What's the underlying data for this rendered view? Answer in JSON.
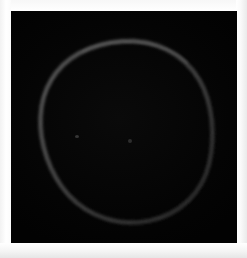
{
  "image": {
    "title": "Dark-field ellipse outline",
    "alt_text": "Faint grey ovoid outline on a black background framed by a white border",
    "frame": {
      "background_color": "#fdfdfd",
      "border_inset_px": 11,
      "width_px": 247,
      "height_px": 258
    },
    "panel": {
      "background_color": "#050505",
      "x_px": 11,
      "y_px": 11,
      "width_px": 226,
      "height_px": 232
    }
  },
  "chart_data": {
    "type": "scatter",
    "title": "Dark-field ellipse outline",
    "subtitle": "",
    "xlabel": "",
    "ylabel": "",
    "xlim": [
      0,
      226
    ],
    "ylim": [
      0,
      232
    ],
    "grid": false,
    "legend": "none",
    "background_color": "#050505",
    "annotations": [],
    "shapes": [
      {
        "name": "ellipse-outline",
        "kind": "closed-curve",
        "center_x": 118,
        "center_y": 124,
        "radius_x": 82,
        "radius_y": 94,
        "rotation_deg": -4,
        "stroke_color": "#4a4a4a",
        "stroke_width_px": 3,
        "fill": "none",
        "notes": "slightly irregular ovoid; brighter along upper-left arc, dimmer at lower-right"
      }
    ],
    "points": [
      {
        "name": "speck-left",
        "x": 66,
        "y": 126,
        "brightness": 0.07
      },
      {
        "name": "speck-center",
        "x": 119,
        "y": 130,
        "brightness": 0.06
      }
    ]
  }
}
